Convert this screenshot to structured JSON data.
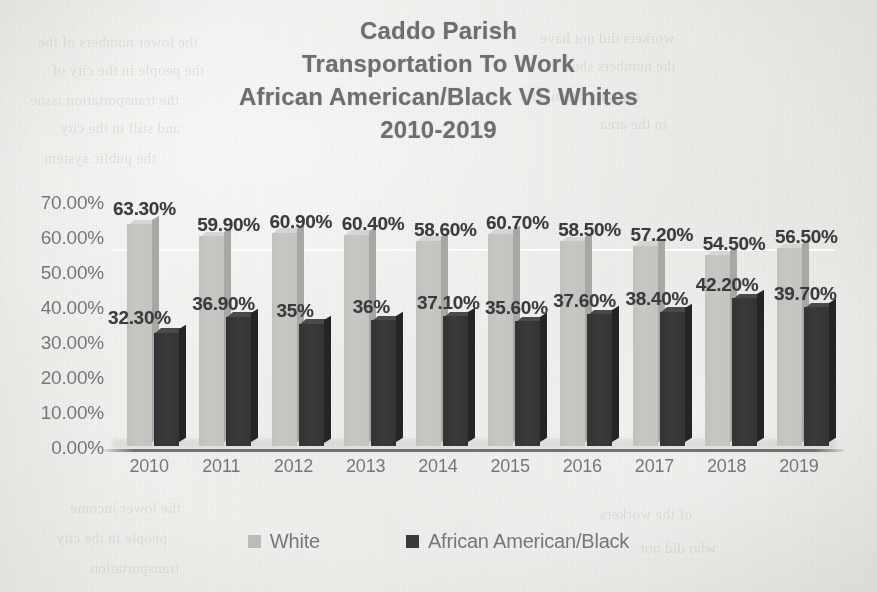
{
  "title": {
    "line1": "Caddo Parish",
    "line2": "Transportation To Work",
    "line3": "African American/Black VS Whites",
    "line4": "2010-2019"
  },
  "legend": {
    "items": [
      {
        "label": "White",
        "color": "#bcbbb7",
        "swatch_name": "legend-swatch-white"
      },
      {
        "label": "African American/Black",
        "color": "#3a3a3d",
        "swatch_name": "legend-swatch-black"
      }
    ]
  },
  "axes": {
    "y_ticks": [
      "70.00%",
      "60.00%",
      "50.00%",
      "40.00%",
      "30.00%",
      "20.00%",
      "10.00%",
      "0.00%"
    ],
    "x_ticks": [
      "2010",
      "2011",
      "2012",
      "2013",
      "2014",
      "2015",
      "2016",
      "2017",
      "2018",
      "2019"
    ]
  },
  "bleed_through": [
    {
      "text": "the lower numbers of the",
      "x": 38,
      "y": 34
    },
    {
      "text": "the people in the city of",
      "x": 52,
      "y": 62
    },
    {
      "text": "the transportation issue",
      "x": 30,
      "y": 92
    },
    {
      "text": "and still in the city",
      "x": 60,
      "y": 120
    },
    {
      "text": "the public system",
      "x": 44,
      "y": 150
    },
    {
      "text": "workers did not have",
      "x": 540,
      "y": 30
    },
    {
      "text": "the numbers show",
      "x": 560,
      "y": 58
    },
    {
      "text": "transportation data",
      "x": 520,
      "y": 88
    },
    {
      "text": "in the area",
      "x": 600,
      "y": 116
    },
    {
      "text": "the lower income",
      "x": 70,
      "y": 500
    },
    {
      "text": "people in the city",
      "x": 56,
      "y": 530
    },
    {
      "text": "transportation",
      "x": 90,
      "y": 560
    },
    {
      "text": "of the workers",
      "x": 600,
      "y": 506
    },
    {
      "text": "who did not",
      "x": 640,
      "y": 540
    }
  ],
  "chart_data": {
    "type": "bar",
    "title": "Caddo Parish Transportation To Work African American/Black VS Whites 2010-2019",
    "xlabel": "",
    "ylabel": "",
    "ylim": [
      0,
      70
    ],
    "grid": true,
    "legend_position": "bottom",
    "categories": [
      "2010",
      "2011",
      "2012",
      "2013",
      "2014",
      "2015",
      "2016",
      "2017",
      "2018",
      "2019"
    ],
    "series": [
      {
        "name": "White",
        "color": "#c5c4c0",
        "values": [
          63.3,
          59.9,
          60.9,
          60.4,
          58.6,
          60.7,
          58.5,
          57.2,
          54.5,
          56.5
        ],
        "labels": [
          "63.30%",
          "59.90%",
          "60.90%",
          "60.40%",
          "58.60%",
          "60.70%",
          "58.50%",
          "57.20%",
          "54.50%",
          "56.50%"
        ]
      },
      {
        "name": "African American/Black",
        "color": "#3a3a3d",
        "values": [
          32.3,
          36.9,
          35.0,
          36.0,
          37.1,
          35.6,
          37.6,
          38.4,
          42.2,
          39.7
        ],
        "labels": [
          "32.30%",
          "36.90%",
          "35%",
          "36%",
          "37.10%",
          "35.60%",
          "37.60%",
          "38.40%",
          "42.20%",
          "39.70%"
        ]
      }
    ]
  }
}
